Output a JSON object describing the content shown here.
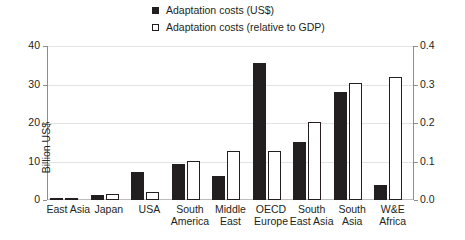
{
  "legend": {
    "position": "top-center",
    "items": [
      {
        "marker": "filled-square",
        "label": "Adaptation costs (US$)",
        "color": "#231f20"
      },
      {
        "marker": "open-square",
        "label": "Adaptation costs (relative to GDP)",
        "color": "#ffffff"
      }
    ]
  },
  "axes": {
    "left": {
      "title": "Billion US$",
      "ticks": [
        "0",
        "10",
        "20",
        "30",
        "40"
      ],
      "min": 0,
      "max": 40
    },
    "right": {
      "title": "Share of GDP (%)",
      "ticks": [
        "0.0",
        "0.1",
        "0.2",
        "0.3",
        "0.4"
      ],
      "min": 0,
      "max": 0.4
    }
  },
  "chart_data": {
    "type": "bar",
    "title": "",
    "xlabel": "",
    "ylabel": "Billion US$",
    "y2label": "Share of GDP (%)",
    "ylim": [
      0,
      40
    ],
    "y2lim": [
      0,
      0.4
    ],
    "grid": true,
    "legend_position": "top-center",
    "categories": [
      "East Asia",
      "Japan",
      "USA",
      "South America",
      "Middle East",
      "OECD Europe",
      "South East Asia",
      "South Asia",
      "W&E Africa"
    ],
    "series": [
      {
        "name": "Adaptation costs (US$)",
        "axis": "left",
        "unit": "Billion US$",
        "color": "#231f20",
        "values": [
          0.6,
          1.2,
          7.2,
          9.3,
          6.3,
          35.5,
          15.0,
          28.0,
          4.0
        ]
      },
      {
        "name": "Adaptation costs (relative to GDP)",
        "axis": "right",
        "unit": "% of GDP",
        "color": "#ffffff",
        "values": [
          0.004,
          0.015,
          0.02,
          0.102,
          0.128,
          0.128,
          0.203,
          0.305,
          0.32
        ]
      }
    ]
  }
}
